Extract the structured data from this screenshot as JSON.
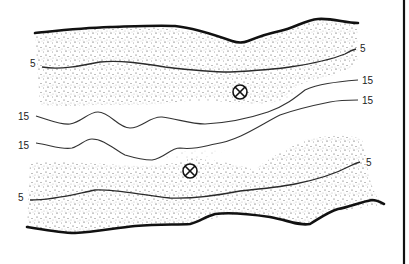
{
  "figure": {
    "type": "bathymetric channel contour sketch",
    "colors": {
      "ink": "#111111",
      "stipple": "#555555",
      "background": "#ffffff"
    },
    "contours": {
      "top_bank_5": {
        "label_left": "5",
        "label_right": "5"
      },
      "upper_15": {
        "label_left": "15",
        "label_right": "15"
      },
      "lower_15": {
        "label_left": "15",
        "label_right": "15"
      },
      "bottom_bank_5": {
        "label_left": "5",
        "label_right": "5"
      }
    },
    "markers": [
      {
        "symbol": "circle-x",
        "position": "upper channel, near top bank"
      },
      {
        "symbol": "circle-x",
        "position": "lower channel, near bottom bank"
      }
    ]
  }
}
